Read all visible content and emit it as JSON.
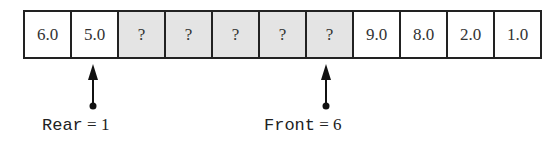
{
  "diagram": {
    "type": "circular-queue-array",
    "cells": [
      {
        "index": 0,
        "value": "6.0",
        "empty": false
      },
      {
        "index": 1,
        "value": "5.0",
        "empty": false
      },
      {
        "index": 2,
        "value": "?",
        "empty": true
      },
      {
        "index": 3,
        "value": "?",
        "empty": true
      },
      {
        "index": 4,
        "value": "?",
        "empty": true
      },
      {
        "index": 5,
        "value": "?",
        "empty": true
      },
      {
        "index": 6,
        "value": "?",
        "empty": true
      },
      {
        "index": 7,
        "value": "9.0",
        "empty": false
      },
      {
        "index": 8,
        "value": "8.0",
        "empty": false
      },
      {
        "index": 9,
        "value": "2.0",
        "empty": false
      },
      {
        "index": 10,
        "value": "1.0",
        "empty": false
      }
    ],
    "pointers": {
      "rear": {
        "name": "Rear",
        "eq": "=",
        "value": "1",
        "cell_index": 1
      },
      "front": {
        "name": "Front",
        "eq": "=",
        "value": "6",
        "cell_index": 6
      }
    },
    "colors": {
      "empty_cell_fill": "#e4e4e4",
      "filled_cell_fill": "#ffffff",
      "border": "#222222"
    }
  }
}
